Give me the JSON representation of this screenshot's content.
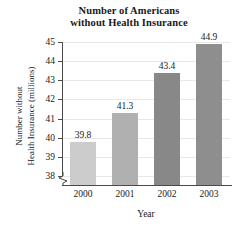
{
  "chart_data": {
    "type": "bar",
    "title": "Number of Americans without Health Insurance",
    "title_lines": [
      "Number of Americans",
      "without Health Insurance"
    ],
    "xlabel": "Year",
    "ylabel": "Number without Health Insurance (millions)",
    "ylabel_lines": [
      "Number without",
      "Health Insurance (millions)"
    ],
    "categories": [
      "2000",
      "2001",
      "2002",
      "2003"
    ],
    "values": [
      39.8,
      41.3,
      43.4,
      44.9
    ],
    "value_labels": [
      "39.8",
      "41.3",
      "43.4",
      "44.9"
    ],
    "ylim": [
      37.5,
      45
    ],
    "yticks": [
      38,
      39,
      40,
      41,
      42,
      43,
      44,
      45
    ],
    "ytick_labels": [
      "38",
      "39",
      "40",
      "41",
      "42",
      "43",
      "44",
      "45"
    ],
    "grid": true,
    "legend": false,
    "axis_break": true,
    "bar_colors": [
      "#cccccc",
      "#b0b0b0",
      "#888888",
      "#8e8e8e"
    ],
    "grid_color": "#e8e8e8",
    "axis_color": "#4a4a4a",
    "text_color": "#1a1a1a"
  }
}
